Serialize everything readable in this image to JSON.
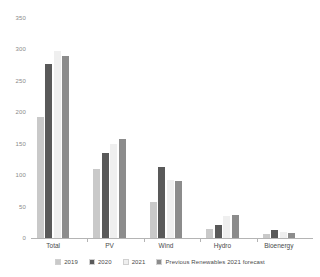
{
  "chart_data": {
    "type": "bar",
    "title": "",
    "subtitle": "",
    "xlabel": "",
    "ylabel": "",
    "categories": [
      "Total",
      "PV",
      "Wind",
      "Hydro",
      "Bioenergy"
    ],
    "series": [
      {
        "name": "2019",
        "color": "#c9c9c9",
        "values": [
          192,
          110,
          58,
          14,
          6
        ]
      },
      {
        "name": "2020",
        "color": "#595959",
        "values": [
          277,
          135,
          113,
          21,
          12
        ]
      },
      {
        "name": "2021",
        "color": "#efefef",
        "values": [
          298,
          150,
          93,
          35,
          9
        ]
      },
      {
        "name": "Previous Renewables 2021 forecast",
        "color": "#8c8c8c",
        "values": [
          290,
          157,
          90,
          36,
          8
        ]
      }
    ],
    "ylim": [
      0,
      350
    ],
    "yticks": [
      0,
      50,
      100,
      150,
      200,
      250,
      300,
      350
    ],
    "ytick_labels": [
      "0",
      "50",
      "100",
      "150",
      "200",
      "250",
      "300",
      "350"
    ],
    "grid": false,
    "legend_position": "bottom",
    "axis_color": "#b4b4b4",
    "tick_label_color": "#8a8a8a",
    "category_label_color": "#4a4a4a"
  }
}
